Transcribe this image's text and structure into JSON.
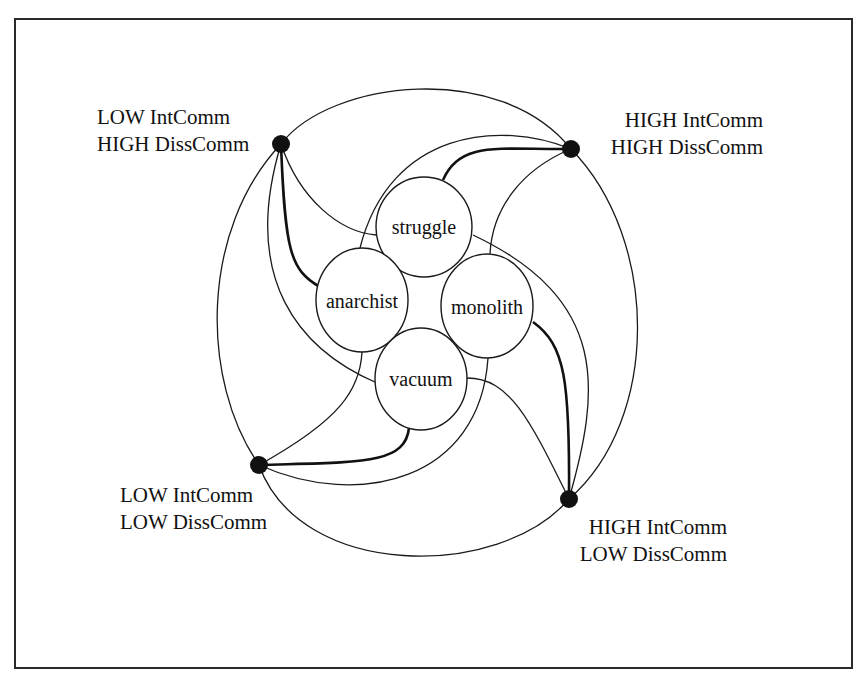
{
  "diagram": {
    "type": "network-typology",
    "colors": {
      "line": "#1a1a1a",
      "node_fill": "#ffffff",
      "dot": "#111111",
      "frame": "#2a2a2a"
    },
    "central_nodes": [
      {
        "id": "struggle",
        "label": "struggle"
      },
      {
        "id": "anarchist",
        "label": "anarchist"
      },
      {
        "id": "monolith",
        "label": "monolith"
      },
      {
        "id": "vacuum",
        "label": "vacuum"
      }
    ],
    "corners": [
      {
        "id": "tl",
        "line1": "LOW IntComm",
        "line2": "HIGH DissComm"
      },
      {
        "id": "tr",
        "line1": "HIGH IntComm",
        "line2": "HIGH DissComm"
      },
      {
        "id": "bl",
        "line1": "LOW IntComm",
        "line2": "LOW DissComm"
      },
      {
        "id": "br",
        "line1": "HIGH IntComm",
        "line2": "LOW DissComm"
      }
    ],
    "edges": [
      {
        "from": "tl",
        "to": "tr",
        "weight": "thin"
      },
      {
        "from": "tl",
        "to": "bl",
        "weight": "thin"
      },
      {
        "from": "tr",
        "to": "br",
        "weight": "thin"
      },
      {
        "from": "bl",
        "to": "br",
        "weight": "thin"
      },
      {
        "from": "tl",
        "to": "anarchist",
        "weight": "thick"
      },
      {
        "from": "tl",
        "to": "struggle",
        "weight": "thin"
      },
      {
        "from": "tl",
        "to": "vacuum",
        "weight": "thin"
      },
      {
        "from": "tr",
        "to": "struggle",
        "weight": "thick"
      },
      {
        "from": "tr",
        "to": "anarchist",
        "weight": "thin"
      },
      {
        "from": "tr",
        "to": "monolith",
        "weight": "thin"
      },
      {
        "from": "br",
        "to": "monolith",
        "weight": "thick"
      },
      {
        "from": "br",
        "to": "struggle",
        "weight": "thin"
      },
      {
        "from": "br",
        "to": "vacuum",
        "weight": "thin"
      },
      {
        "from": "bl",
        "to": "vacuum",
        "weight": "thick"
      },
      {
        "from": "bl",
        "to": "anarchist",
        "weight": "thin"
      },
      {
        "from": "bl",
        "to": "monolith",
        "weight": "thin"
      }
    ]
  }
}
